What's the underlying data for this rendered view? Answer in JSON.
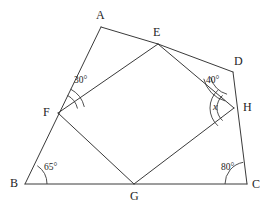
{
  "figure": {
    "stroke_color": "#3a3a3a",
    "text_color": "#1d1d1d",
    "background": "#ffffff",
    "width": 271,
    "height": 209
  },
  "vertices": [
    {
      "name": "A",
      "label": "A",
      "x": 101,
      "y": 27,
      "label_x": 96,
      "label_y": 9
    },
    {
      "name": "E",
      "label": "E",
      "x": 158,
      "y": 44,
      "label_x": 153,
      "label_y": 26
    },
    {
      "name": "D",
      "label": "D",
      "x": 233,
      "y": 72,
      "label_x": 234,
      "label_y": 55
    },
    {
      "name": "H",
      "label": "H",
      "x": 234,
      "y": 108,
      "label_x": 243,
      "label_y": 101
    },
    {
      "name": "C",
      "label": "C",
      "x": 247,
      "y": 184,
      "label_x": 252,
      "label_y": 178
    },
    {
      "name": "G",
      "label": "G",
      "x": 134,
      "y": 184,
      "label_x": 130,
      "label_y": 190
    },
    {
      "name": "B",
      "label": "B",
      "x": 25,
      "y": 184,
      "label_x": 10,
      "label_y": 177
    },
    {
      "name": "F",
      "label": "F",
      "x": 58,
      "y": 113,
      "label_x": 43,
      "label_y": 106
    }
  ],
  "segments": [
    {
      "name": "AE",
      "from": "A",
      "to": "E"
    },
    {
      "name": "ED",
      "from": "E",
      "to": "D"
    },
    {
      "name": "DC",
      "from": "D",
      "to": "C"
    },
    {
      "name": "CB",
      "from": "C",
      "to": "B"
    },
    {
      "name": "BA",
      "from": "B",
      "to": "A"
    },
    {
      "name": "EF",
      "from": "E",
      "to": "F"
    },
    {
      "name": "FG",
      "from": "F",
      "to": "G"
    },
    {
      "name": "GH",
      "from": "G",
      "to": "H"
    },
    {
      "name": "HE",
      "from": "H",
      "to": "E"
    }
  ],
  "angles": [
    {
      "name": "angle-at-F",
      "label": "30°",
      "vertex": "F",
      "label_x": 74,
      "label_y": 76,
      "arcs": [
        {
          "r": 20,
          "start": -62,
          "end": -13
        },
        {
          "r": 27,
          "start": -62,
          "end": -13
        }
      ]
    },
    {
      "name": "angle-at-D",
      "label": "40°",
      "vertex": "D",
      "label_x": 206,
      "label_y": 76,
      "arcs": [
        {
          "r": 23,
          "start": 105,
          "end": 167
        },
        {
          "r": 30,
          "start": 105,
          "end": 167
        }
      ]
    },
    {
      "name": "angle-at-H",
      "label": "x",
      "italic": true,
      "vertex": "H",
      "label_x": 213,
      "label_y": 102,
      "arcs": [
        {
          "r": 17,
          "start": 132,
          "end": 228
        },
        {
          "r": 24,
          "start": 132,
          "end": 228
        }
      ]
    },
    {
      "name": "angle-at-B",
      "label": "65°",
      "vertex": "B",
      "label_x": 44,
      "label_y": 163,
      "arcs": [
        {
          "r": 22,
          "start": -56,
          "end": 0
        }
      ]
    },
    {
      "name": "angle-at-C",
      "label": "80°",
      "vertex": "C",
      "label_x": 221,
      "label_y": 163,
      "arcs": [
        {
          "r": 22,
          "start": 180,
          "end": 260
        }
      ]
    }
  ]
}
